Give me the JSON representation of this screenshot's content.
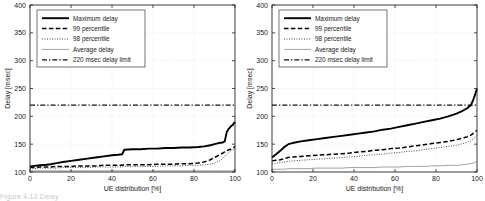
{
  "figure": {
    "panel_count": 2,
    "background_color": "#ffffff",
    "axis_color": "#262626",
    "grid_color": "#cfcfcf",
    "partial_caption": "Figure 4.13  Delay"
  },
  "legend": {
    "position": "top-left",
    "entries": [
      {
        "label": "Maximum delay",
        "style": "solid-thick",
        "color": "#000000"
      },
      {
        "label": "99 percentile",
        "style": "dashed",
        "color": "#000000"
      },
      {
        "label": "98 percentile",
        "style": "dotted",
        "color": "#000000"
      },
      {
        "label": "Average delay",
        "style": "solid-thin",
        "color": "#777777"
      },
      {
        "label": "220 msec delay limit",
        "style": "dash-dot",
        "color": "#000000"
      }
    ]
  },
  "chart_data": [
    {
      "type": "line",
      "title": "",
      "panel": "left",
      "xlabel": "UE distribution [%]",
      "ylabel": "Delay [msec]",
      "xlim": [
        0,
        100
      ],
      "ylim": [
        100,
        400
      ],
      "xticks": [
        0,
        20,
        40,
        60,
        80,
        100
      ],
      "yticks": [
        100,
        150,
        200,
        250,
        300,
        350,
        400
      ],
      "grid": true,
      "legend_position": "top-left",
      "x": [
        0,
        2,
        5,
        8,
        10,
        13,
        16,
        20,
        24,
        28,
        32,
        36,
        40,
        43,
        45,
        46,
        50,
        54,
        58,
        62,
        66,
        70,
        74,
        78,
        82,
        85,
        88,
        90,
        92,
        94,
        95,
        96,
        97,
        98,
        99,
        100
      ],
      "series": [
        {
          "name": "Maximum delay",
          "style": "solid-thick",
          "values": [
            110,
            111,
            112,
            113,
            114,
            116,
            118,
            120,
            122,
            124,
            126,
            128,
            130,
            131,
            132,
            140,
            141,
            141,
            142,
            142,
            143,
            143,
            144,
            144,
            145,
            146,
            148,
            150,
            152,
            153,
            155,
            172,
            178,
            182,
            185,
            190
          ]
        },
        {
          "name": "99 percentile",
          "style": "dashed",
          "values": [
            108,
            108,
            109,
            109,
            109,
            110,
            110,
            110,
            111,
            111,
            111,
            112,
            112,
            112,
            112,
            113,
            113,
            113,
            113,
            114,
            114,
            114,
            115,
            115,
            116,
            118,
            122,
            126,
            130,
            134,
            136,
            138,
            140,
            141,
            143,
            146
          ]
        },
        {
          "name": "98 percentile",
          "style": "dotted",
          "values": [
            106,
            106,
            107,
            107,
            107,
            107,
            108,
            108,
            108,
            108,
            109,
            109,
            109,
            109,
            109,
            110,
            110,
            110,
            110,
            110,
            111,
            111,
            111,
            112,
            112,
            113,
            114,
            116,
            119,
            124,
            128,
            132,
            135,
            138,
            140,
            143
          ]
        },
        {
          "name": "Average delay",
          "style": "solid-thin",
          "values": [
            102,
            102,
            102,
            102,
            102,
            102,
            102,
            102,
            102,
            102,
            102,
            102,
            102,
            102,
            102,
            102,
            102,
            102,
            102,
            102,
            102,
            102,
            102,
            102,
            102,
            102,
            102,
            102,
            102,
            102,
            102,
            102,
            102,
            102,
            102,
            103
          ]
        },
        {
          "name": "220 msec delay limit",
          "style": "dash-dot",
          "values": [
            220,
            220,
            220,
            220,
            220,
            220,
            220,
            220,
            220,
            220,
            220,
            220,
            220,
            220,
            220,
            220,
            220,
            220,
            220,
            220,
            220,
            220,
            220,
            220,
            220,
            220,
            220,
            220,
            220,
            220,
            220,
            220,
            220,
            220,
            220,
            220
          ]
        }
      ]
    },
    {
      "type": "line",
      "title": "",
      "panel": "right",
      "xlabel": "UE distribution [%]",
      "ylabel": "Delay [msec]",
      "xlim": [
        0,
        100
      ],
      "ylim": [
        100,
        400
      ],
      "xticks": [
        0,
        20,
        40,
        60,
        80,
        100
      ],
      "yticks": [
        100,
        150,
        200,
        250,
        300,
        350,
        400
      ],
      "grid": true,
      "legend_position": "top-left",
      "x": [
        0,
        2,
        4,
        6,
        8,
        10,
        14,
        18,
        22,
        26,
        30,
        34,
        38,
        42,
        46,
        50,
        54,
        58,
        62,
        66,
        70,
        74,
        78,
        82,
        86,
        90,
        93,
        95,
        97,
        98,
        99,
        100
      ],
      "series": [
        {
          "name": "Maximum delay",
          "style": "solid-thick",
          "values": [
            126,
            132,
            138,
            145,
            150,
            152,
            155,
            157,
            159,
            161,
            163,
            165,
            167,
            169,
            171,
            173,
            176,
            178,
            181,
            184,
            187,
            190,
            193,
            196,
            200,
            205,
            210,
            214,
            220,
            228,
            238,
            250
          ]
        },
        {
          "name": "99 percentile",
          "style": "dashed",
          "values": [
            120,
            121,
            122,
            124,
            126,
            127,
            128,
            129,
            130,
            131,
            132,
            133,
            134,
            136,
            137,
            139,
            140,
            142,
            143,
            145,
            147,
            149,
            151,
            153,
            155,
            158,
            161,
            163,
            166,
            169,
            172,
            175
          ]
        },
        {
          "name": "98 percentile",
          "style": "dotted",
          "values": [
            114,
            116,
            117,
            118,
            119,
            120,
            121,
            122,
            123,
            124,
            125,
            126,
            127,
            128,
            130,
            131,
            132,
            134,
            135,
            137,
            138,
            140,
            142,
            144,
            146,
            148,
            151,
            153,
            156,
            159,
            162,
            166
          ]
        },
        {
          "name": "Average delay",
          "style": "solid-thin",
          "values": [
            105,
            105,
            105,
            105,
            106,
            106,
            106,
            106,
            107,
            107,
            107,
            107,
            108,
            108,
            108,
            108,
            109,
            109,
            109,
            110,
            110,
            110,
            111,
            111,
            112,
            112,
            113,
            114,
            115,
            116,
            117,
            119
          ]
        },
        {
          "name": "220 msec delay limit",
          "style": "dash-dot",
          "values": [
            220,
            220,
            220,
            220,
            220,
            220,
            220,
            220,
            220,
            220,
            220,
            220,
            220,
            220,
            220,
            220,
            220,
            220,
            220,
            220,
            220,
            220,
            220,
            220,
            220,
            220,
            220,
            220,
            220,
            220,
            220,
            220
          ]
        }
      ]
    }
  ]
}
